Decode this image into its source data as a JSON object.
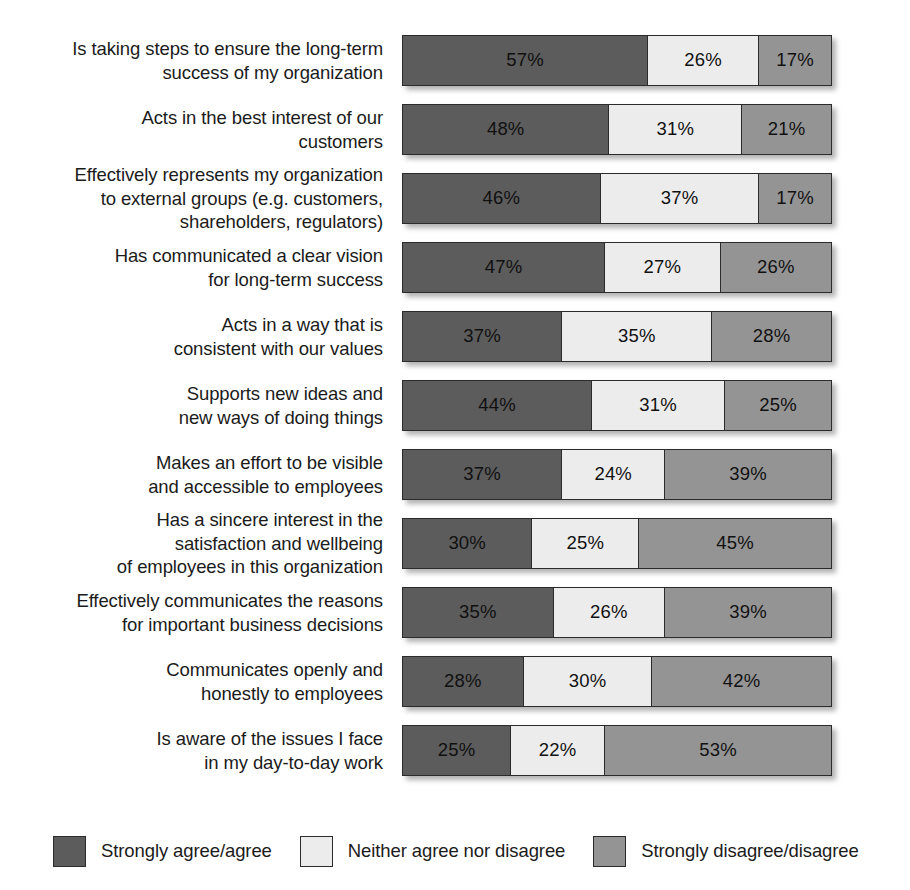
{
  "chart_data": {
    "type": "bar",
    "subtype": "stacked-horizontal-100",
    "title": "",
    "subtitle": "",
    "xlabel": "",
    "ylabel": "",
    "xlim": [
      0,
      100
    ],
    "grid": false,
    "legend_position": "bottom",
    "value_suffix": "%",
    "categories": [
      "Is taking steps to ensure the long-term\nsuccess of my organization",
      "Acts in the best interest of our\ncustomers",
      "Effectively represents my organization\nto external groups (e.g. customers,\nshareholders, regulators)",
      "Has communicated a clear vision\nfor long-term success",
      "Acts in a way that is\nconsistent with our values",
      "Supports new ideas and\nnew ways of doing things",
      "Makes an effort to be visible\nand accessible to employees",
      "Has a sincere interest in the\nsatisfaction and wellbeing\nof employees in this organization",
      "Effectively communicates the reasons\nfor important business decisions",
      "Communicates openly and\nhonestly to employees",
      "Is aware of the issues I face\nin my day-to-day work"
    ],
    "series": [
      {
        "name": "Strongly agree/agree",
        "color": "#5c5c5c",
        "values": [
          57,
          48,
          46,
          47,
          37,
          44,
          37,
          30,
          35,
          28,
          25
        ],
        "labels": [
          "57%",
          "48%",
          "46%",
          "47%",
          "37%",
          "44%",
          "37%",
          "30%",
          "35%",
          "28%",
          "25%"
        ]
      },
      {
        "name": "Neither agree nor disagree",
        "color": "#ececec",
        "values": [
          26,
          31,
          37,
          27,
          35,
          31,
          24,
          25,
          26,
          30,
          22
        ],
        "labels": [
          "26%",
          "31%",
          "37%",
          "27%",
          "35%",
          "31%",
          "24%",
          "25%",
          "26%",
          "30%",
          "22%"
        ]
      },
      {
        "name": "Strongly disagree/disagree",
        "color": "#949494",
        "values": [
          17,
          21,
          17,
          26,
          28,
          25,
          39,
          45,
          39,
          42,
          53
        ],
        "labels": [
          "17%",
          "21%",
          "17%",
          "26%",
          "28%",
          "25%",
          "39%",
          "45%",
          "39%",
          "42%",
          "53%"
        ]
      }
    ],
    "rows": [
      {
        "label": "Is taking steps to ensure the long-term\nsuccess of my organization",
        "segments": [
          {
            "value": 57,
            "label": "57%"
          },
          {
            "value": 26,
            "label": "26%"
          },
          {
            "value": 17,
            "label": "17%"
          }
        ]
      },
      {
        "label": "Acts in the best interest of our\ncustomers",
        "segments": [
          {
            "value": 48,
            "label": "48%"
          },
          {
            "value": 31,
            "label": "31%"
          },
          {
            "value": 21,
            "label": "21%"
          }
        ]
      },
      {
        "label": "Effectively represents my organization\nto external groups (e.g. customers,\nshareholders, regulators)",
        "segments": [
          {
            "value": 46,
            "label": "46%"
          },
          {
            "value": 37,
            "label": "37%"
          },
          {
            "value": 17,
            "label": "17%"
          }
        ]
      },
      {
        "label": "Has communicated a clear vision\nfor long-term success",
        "segments": [
          {
            "value": 47,
            "label": "47%"
          },
          {
            "value": 27,
            "label": "27%"
          },
          {
            "value": 26,
            "label": "26%"
          }
        ]
      },
      {
        "label": "Acts in a way that is\nconsistent with our values",
        "segments": [
          {
            "value": 37,
            "label": "37%"
          },
          {
            "value": 35,
            "label": "35%"
          },
          {
            "value": 28,
            "label": "28%"
          }
        ]
      },
      {
        "label": "Supports new ideas and\nnew ways of doing things",
        "segments": [
          {
            "value": 44,
            "label": "44%"
          },
          {
            "value": 31,
            "label": "31%"
          },
          {
            "value": 25,
            "label": "25%"
          }
        ]
      },
      {
        "label": "Makes an effort to be visible\nand accessible to employees",
        "segments": [
          {
            "value": 37,
            "label": "37%"
          },
          {
            "value": 24,
            "label": "24%"
          },
          {
            "value": 39,
            "label": "39%"
          }
        ]
      },
      {
        "label": "Has a sincere interest in the\nsatisfaction and wellbeing\nof employees in this organization",
        "segments": [
          {
            "value": 30,
            "label": "30%"
          },
          {
            "value": 25,
            "label": "25%"
          },
          {
            "value": 45,
            "label": "45%"
          }
        ]
      },
      {
        "label": "Effectively communicates the reasons\nfor important business decisions",
        "segments": [
          {
            "value": 35,
            "label": "35%"
          },
          {
            "value": 26,
            "label": "26%"
          },
          {
            "value": 39,
            "label": "39%"
          }
        ]
      },
      {
        "label": "Communicates openly and\nhonestly to employees",
        "segments": [
          {
            "value": 28,
            "label": "28%"
          },
          {
            "value": 30,
            "label": "30%"
          },
          {
            "value": 42,
            "label": "42%"
          }
        ]
      },
      {
        "label": "Is aware of the issues I face\nin my day-to-day work",
        "segments": [
          {
            "value": 25,
            "label": "25%"
          },
          {
            "value": 22,
            "label": "22%"
          },
          {
            "value": 53,
            "label": "53%"
          }
        ]
      }
    ],
    "legend": [
      {
        "label": "Strongly agree/agree",
        "color": "#5c5c5c"
      },
      {
        "label": "Neither agree nor disagree",
        "color": "#ececec"
      },
      {
        "label": "Strongly disagree/disagree",
        "color": "#949494"
      }
    ]
  },
  "colors": {
    "agree": "#5c5c5c",
    "neither": "#ececec",
    "disagree": "#949494",
    "outline": "#2b2b2b",
    "text": "#1b1b1b",
    "background": "#ffffff"
  }
}
